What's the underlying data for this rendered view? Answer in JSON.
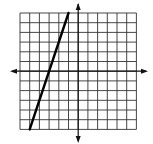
{
  "chart_data": {
    "type": "line",
    "title": "",
    "xlabel": "",
    "ylabel": "",
    "xlim": [
      -6,
      6
    ],
    "ylim": [
      -6,
      6
    ],
    "grid": true,
    "grid_step": 1,
    "axes_arrows": true,
    "tick_labels": false,
    "legend": null,
    "series": [
      {
        "name": "line",
        "equation": "y = 3x + 9",
        "slope": 3,
        "intercept": 9,
        "x": [
          -5,
          -1
        ],
        "y": [
          -6,
          6
        ]
      }
    ]
  },
  "colors": {
    "grid": "#333333",
    "axis": "#111111",
    "line": "#000000",
    "background": "#ffffff"
  },
  "layout": {
    "grid_left": 20,
    "grid_top": 13,
    "cell": 9.7
  }
}
